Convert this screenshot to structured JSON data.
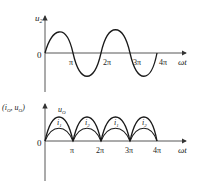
{
  "top_plot": {
    "y_label_main": "u",
    "y_label_sub": "2",
    "origin_label": "0",
    "x_label": "ωt",
    "ticks": [
      "π",
      "2π",
      "3π",
      "4π"
    ]
  },
  "bottom_plot": {
    "y_label": "(i",
    "y_label_sub1": "O",
    "y_label_mid": ", u",
    "y_label_sub2": "O",
    "y_label_end": ")",
    "curve_label_uo_main": "u",
    "curve_label_uo_sub": "O",
    "curve_labels_i": [
      {
        "main": "i",
        "sub": "1"
      },
      {
        "main": "i",
        "sub": "2"
      },
      {
        "main": "i",
        "sub": "1"
      },
      {
        "main": "i",
        "sub": "2"
      }
    ],
    "origin_label": "0",
    "x_label": "ωt",
    "ticks": [
      "π",
      "2π",
      "3π",
      "4π"
    ]
  },
  "colors": {
    "stroke": "#1a1a1a",
    "axis": "#444444"
  }
}
